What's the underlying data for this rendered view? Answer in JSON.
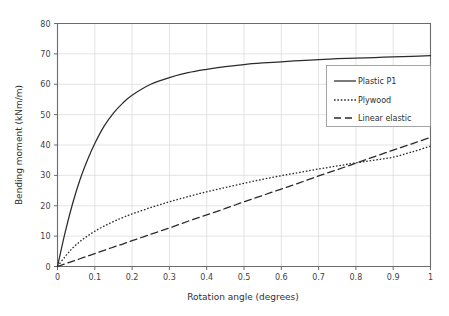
{
  "chart_data": {
    "type": "line",
    "title": "",
    "xlabel": "Rotation angle (degrees)",
    "ylabel": "Bending moment (kNm/m)",
    "xlim": [
      0,
      1
    ],
    "ylim": [
      0,
      80
    ],
    "grid": true,
    "legend_position": "upper-right",
    "x_ticks": [
      "0",
      "0.1",
      "0.2",
      "0.3",
      "0.4",
      "0.5",
      "0.6",
      "0.7",
      "0.8",
      "0.9",
      "1"
    ],
    "x_tick_values": [
      0,
      0.1,
      0.2,
      0.3,
      0.4,
      0.5,
      0.6,
      0.7,
      0.8,
      0.9,
      1
    ],
    "y_ticks": [
      "0",
      "10",
      "20",
      "30",
      "40",
      "50",
      "60",
      "70",
      "80"
    ],
    "y_tick_values": [
      0,
      10,
      20,
      30,
      40,
      50,
      60,
      70,
      80
    ],
    "x": [
      0,
      0.02,
      0.04,
      0.06,
      0.08,
      0.1,
      0.125,
      0.15,
      0.175,
      0.2,
      0.25,
      0.3,
      0.35,
      0.4,
      0.45,
      0.5,
      0.55,
      0.6,
      0.65,
      0.7,
      0.75,
      0.8,
      0.85,
      0.9,
      0.95,
      1
    ],
    "series": [
      {
        "name": "Plastic P1",
        "style": "solid",
        "color": "#2b2b2b",
        "values": [
          0,
          11.0,
          20.5,
          28.5,
          35.0,
          40.5,
          46.2,
          50.5,
          53.8,
          56.4,
          60.0,
          62.2,
          63.8,
          64.9,
          65.8,
          66.5,
          67.0,
          67.4,
          67.8,
          68.1,
          68.4,
          68.6,
          68.8,
          69.0,
          69.2,
          69.4
        ]
      },
      {
        "name": "Plywood",
        "style": "dotted",
        "color": "#2b2b2b",
        "values": [
          0,
          3.2,
          6.0,
          8.2,
          10.0,
          11.6,
          13.3,
          14.8,
          16.1,
          17.3,
          19.4,
          21.3,
          23.0,
          24.6,
          26.0,
          27.4,
          28.7,
          29.9,
          31.0,
          32.1,
          33.1,
          34.1,
          35.0,
          36.0,
          37.7,
          39.6
        ]
      },
      {
        "name": "Linear elastic",
        "style": "dashed",
        "color": "#2b2b2b",
        "values": [
          0,
          0.85,
          1.7,
          2.55,
          3.4,
          4.25,
          5.3,
          6.4,
          7.4,
          8.5,
          10.6,
          12.7,
          14.9,
          17.0,
          19.1,
          21.3,
          23.4,
          25.5,
          27.6,
          29.8,
          31.9,
          34.0,
          36.2,
          38.3,
          40.4,
          42.5
        ]
      }
    ]
  },
  "legend": {
    "entries": [
      {
        "label": "Plastic P1"
      },
      {
        "label": "Plywood"
      },
      {
        "label": "Linear elastic"
      }
    ]
  }
}
